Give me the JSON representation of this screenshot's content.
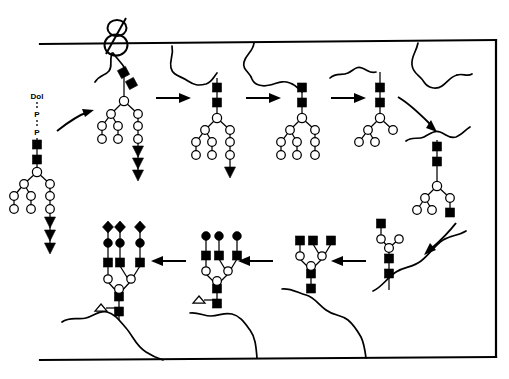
{
  "figure": {
    "background": "#ffffff",
    "ink": "#000000",
    "width": 509,
    "height": 379
  },
  "labels": {
    "dolichol": "Dol",
    "phosphate_1": "P",
    "phosphate_2": "P"
  },
  "legend_shapes": {
    "filled_square": "GlcNAc",
    "open_circle": "Mannose",
    "filled_circle": "Galactose",
    "filled_diamond": "Sialic acid",
    "open_triangle": "Fucose",
    "filled_triangle": "Glucose"
  },
  "membrane": {
    "top_line_label": "lumenal-side membrane boundary",
    "bottom_line_label": "cytosolic-side membrane boundary",
    "right_line_label": "right membrane boundary"
  },
  "steps": [
    {
      "id": "donor",
      "name": "dolichol-pp-oligosaccharide-donor",
      "row": "top",
      "caption": "Dol-P-P linked oligosaccharide precursor"
    },
    {
      "id": "transfer",
      "name": "transferred-glycoprotein",
      "row": "top",
      "caption": "Glycan transferred to nascent protein"
    },
    {
      "id": "trim1",
      "name": "glucose-trimmed-glycan",
      "row": "top",
      "caption": "Glucosidase trimming"
    },
    {
      "id": "trim2",
      "name": "mannose-trimmed-glycan",
      "row": "top",
      "caption": "Mannosidase trimming"
    },
    {
      "id": "trim3",
      "name": "further-trimmed-glycan",
      "row": "top",
      "caption": "Further mannose trimming"
    },
    {
      "id": "glcnac1",
      "name": "glcnac-added-glycan",
      "row": "right",
      "caption": "First GlcNAc added by GlcNAc transferase I"
    },
    {
      "id": "glcnac2",
      "name": "branched-glycan",
      "row": "bottom",
      "caption": "Core branching intermediate"
    },
    {
      "id": "triantenna",
      "name": "triantennary-glcnac-glycan",
      "row": "bottom",
      "caption": "Triantennary GlcNAc glycan"
    },
    {
      "id": "galact",
      "name": "galactosylated-glycan",
      "row": "bottom",
      "caption": "Galactose added to each branch"
    },
    {
      "id": "sialyl",
      "name": "sialylated-complex-glycan",
      "row": "bottom",
      "caption": "Mature sialylated complex glycan with core fucose"
    }
  ],
  "arrows": {
    "top_row": [
      {
        "name": "arrow-donor-to-transfer",
        "direction": "curved-right"
      },
      {
        "name": "arrow-transfer-to-trim1",
        "direction": "right"
      },
      {
        "name": "arrow-trim1-to-trim2",
        "direction": "right"
      },
      {
        "name": "arrow-trim2-to-trim3",
        "direction": "right"
      },
      {
        "name": "arrow-trim3-to-glcnac1",
        "direction": "curved-down-right"
      }
    ],
    "bottom_row": [
      {
        "name": "arrow-glcnac1-to-glcnac2",
        "direction": "curved-down-left"
      },
      {
        "name": "arrow-glcnac2-to-triantenna",
        "direction": "left"
      },
      {
        "name": "arrow-triantenna-to-galact",
        "direction": "left"
      },
      {
        "name": "arrow-galact-to-sialyl",
        "direction": "left"
      }
    ]
  }
}
